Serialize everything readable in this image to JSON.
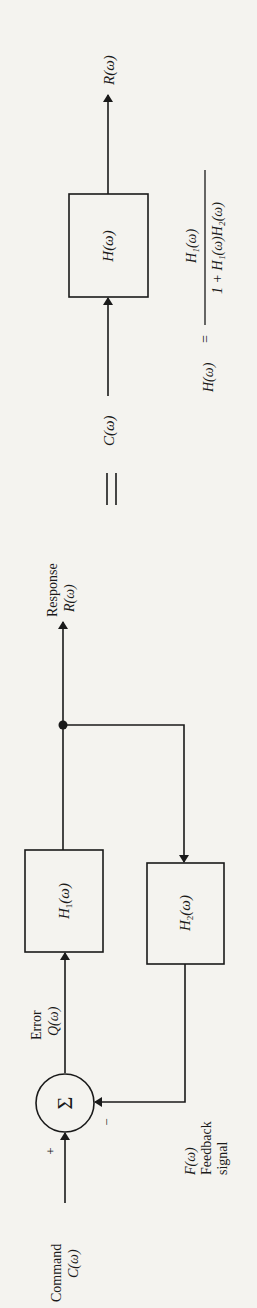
{
  "diagram": {
    "orientation": "rotated 90 degrees counter-clockwise",
    "colors": {
      "ink": "#1a1a1a",
      "paper": "#f4f3ef"
    },
    "feedback_system": {
      "command_label": "Command",
      "command_signal": "C(ω)",
      "plus_sign": "+",
      "minus_sign": "−",
      "summer_symbol": "Σ",
      "error_label": "Error",
      "error_signal": "Q(ω)",
      "forward_block": "H",
      "forward_block_sub": "1",
      "forward_block_arg": "(ω)",
      "feedback_block": "H",
      "feedback_block_sub": "2",
      "feedback_block_arg": "(ω)",
      "response_label": "Response",
      "response_signal": "R(ω)",
      "feedback_signal": "F(ω)",
      "feedback_label_line1": "Feedback",
      "feedback_label_line2": "signal"
    },
    "equivalence_symbol": "=",
    "equivalent_system": {
      "input_signal": "C(ω)",
      "block": "H(ω)",
      "output_signal": "R(ω)",
      "formula_lhs": "H(ω)",
      "formula_eq": "=",
      "formula_numerator": "H₁(ω)",
      "formula_denominator": "1 + H₁(ω)H₂(ω)"
    }
  }
}
